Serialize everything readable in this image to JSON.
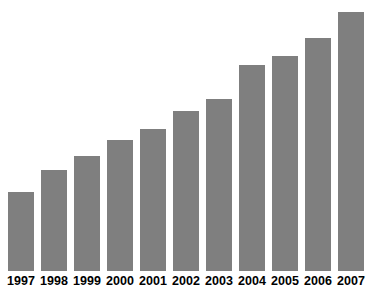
{
  "chart_data": {
    "type": "bar",
    "title": "",
    "subtitle": "",
    "xlabel": "",
    "ylabel": "",
    "categories": [
      "1997",
      "1998",
      "1999",
      "2000",
      "2001",
      "2002",
      "2003",
      "2004",
      "2005",
      "2006",
      "2007"
    ],
    "values": [
      352.8,
      447.6,
      511.6,
      581.8,
      630.8,
      710.0,
      764.1,
      914.0,
      957.5,
      1035.3,
      1149.8
    ],
    "value_labels": [
      "352.8",
      "447.6",
      "511.6",
      "581.8",
      "630.8",
      "710.0",
      "764.1",
      "914.0",
      "957.5",
      "1,035.3",
      "1,149.8"
    ],
    "ylim": [
      0,
      1160
    ],
    "grid": false,
    "legend": null,
    "series": [
      {
        "name": "",
        "values": [
          352.8,
          447.6,
          511.6,
          581.8,
          630.8,
          710.0,
          764.1,
          914.0,
          957.5,
          1035.3,
          1149.8
        ]
      }
    ],
    "colors": {
      "bar": "#7f7f7f",
      "value_label": "#ffffff",
      "category_label": "#000000",
      "background": "#ffffff"
    },
    "annotations": []
  }
}
